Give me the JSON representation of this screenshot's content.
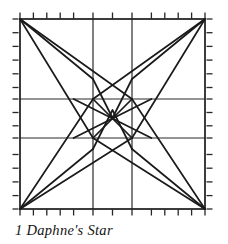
{
  "figure": {
    "title": "Daphne's Star",
    "caption": "1 Daphne's Star",
    "block_number": "1",
    "block_name": "Daphne's Star",
    "type": "quilt-block-piecing-diagram",
    "colors": {
      "line": "#1a1a1a",
      "grid": "#262626",
      "background": "#ffffff",
      "caption": "#141414"
    },
    "frame": {
      "left": 20,
      "top": 19,
      "right": 205,
      "bottom": 209,
      "stroke_width": 1.6
    },
    "grid": {
      "vertical_x": [
        93,
        132
      ],
      "horizontal_y": [
        99,
        138
      ],
      "stroke_width": 1.2,
      "columns": 3,
      "rows": 3
    },
    "ticks": {
      "spacing": 13.2,
      "length": 5,
      "stroke_width": 1.3,
      "count_per_edge": 13,
      "edges": [
        "top",
        "bottom",
        "left",
        "right"
      ]
    },
    "star_paths": {
      "stroke_width": 1.7,
      "corner_rays": [
        {
          "name": "top-left",
          "from": [
            20,
            19
          ],
          "to": [
            [
              93,
              79
            ],
            [
              93,
              138
            ],
            [
              132,
              99
            ]
          ]
        },
        {
          "name": "top-right",
          "from": [
            205,
            19
          ],
          "to": [
            [
              132,
              79
            ],
            [
              132,
              138
            ],
            [
              93,
              99
            ]
          ]
        },
        {
          "name": "bottom-left",
          "from": [
            20,
            209
          ],
          "to": [
            [
              93,
              149
            ],
            [
              93,
              99
            ],
            [
              132,
              138
            ]
          ]
        },
        {
          "name": "bottom-right",
          "from": [
            205,
            209
          ],
          "to": [
            [
              132,
              149
            ],
            [
              132,
              99
            ],
            [
              93,
              138
            ]
          ]
        }
      ],
      "center_cross": [
        {
          "from": [
            93,
            99
          ],
          "to": [
            132,
            138
          ]
        },
        {
          "from": [
            132,
            99
          ],
          "to": [
            93,
            138
          ]
        }
      ],
      "chevrons": [
        {
          "name": "top-chevron",
          "points": [
            [
              93,
              79
            ],
            [
              112,
              118
            ],
            [
              132,
              79
            ]
          ]
        },
        {
          "name": "bottom-chevron",
          "points": [
            [
              93,
              149
            ],
            [
              112,
              110
            ],
            [
              132,
              149
            ]
          ]
        },
        {
          "name": "left-chevron",
          "points": [
            [
              73,
              99
            ],
            [
              112,
              118
            ],
            [
              73,
              138
            ]
          ]
        },
        {
          "name": "right-chevron",
          "points": [
            [
              152,
              99
            ],
            [
              112,
              118
            ],
            [
              152,
              138
            ]
          ]
        }
      ]
    }
  }
}
